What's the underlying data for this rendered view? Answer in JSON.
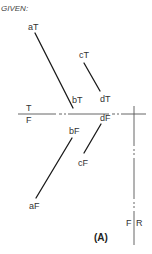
{
  "header": {
    "given_label": "GIVEN:"
  },
  "caption": "(A)",
  "fold_lines": {
    "horizontal": {
      "label_top": "T",
      "label_bottom": "F",
      "y": 114,
      "x1": 18,
      "x2": 146,
      "gap_dash_from": 57,
      "gap_dash_to": 73,
      "gap2_from": 110,
      "gap2_to": 125
    },
    "vertical": {
      "label_left": "F",
      "label_right": "R",
      "x": 134,
      "y1": 106,
      "y2": 245
    }
  },
  "points": {
    "aT": {
      "label": "aT",
      "x": 35,
      "y": 33
    },
    "bT": {
      "label": "bT",
      "x": 73,
      "y": 108
    },
    "cT": {
      "label": "cT",
      "x": 83,
      "y": 60
    },
    "dT": {
      "label": "dT",
      "x": 100,
      "y": 92
    },
    "aF": {
      "label": "aF",
      "x": 36,
      "y": 200
    },
    "bF": {
      "label": "bF",
      "x": 72,
      "y": 137
    },
    "cF": {
      "label": "cF",
      "x": 83,
      "y": 155
    },
    "dF": {
      "label": "dF",
      "x": 101,
      "y": 122
    }
  },
  "segments": [
    {
      "name": "aT-bT",
      "from": "aT",
      "to": "bT"
    },
    {
      "name": "cT-dT",
      "from": "cT",
      "to": "dT"
    },
    {
      "name": "aF-bF",
      "from": "aF",
      "to": "bF"
    },
    {
      "name": "cF-dF",
      "from": "cF",
      "to": "dF"
    }
  ],
  "colors": {
    "line": "#1a1a1a",
    "fold": "#555555",
    "text": "#333333"
  }
}
